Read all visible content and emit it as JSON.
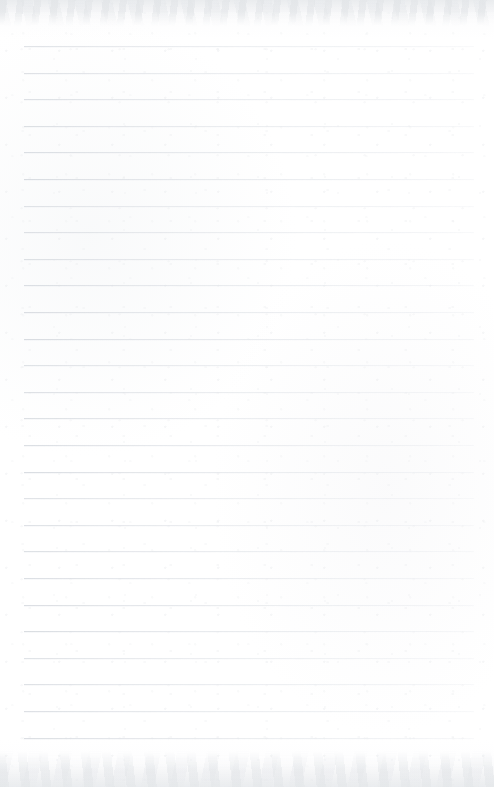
{
  "document": {
    "type": "lined-notebook-paper",
    "title": "",
    "content_text": "",
    "is_blank": true,
    "page_width": 494,
    "page_height": 787
  },
  "paper": {
    "background_color": "#fefefe",
    "texture": "subtle paper grain with mottled scan artifact bands at top and bottom edges",
    "edge_bands": [
      {
        "name": "top-scan-texture",
        "position": "top",
        "height": 26
      },
      {
        "name": "bottom-scan-texture",
        "position": "bottom",
        "height": 36
      }
    ]
  },
  "ruling": {
    "line_color": "#d6dadf",
    "line_color_faded": "#eef0f3",
    "line_count": 27,
    "first_line_y": 46,
    "line_spacing": 26.6,
    "line_start_x": 24,
    "line_end_x": 474,
    "line_thickness": 1,
    "has_vertical_margin_rule": false,
    "lines_y": [
      46,
      72.6,
      99.2,
      125.8,
      152.4,
      179,
      205.6,
      232.2,
      258.8,
      285.4,
      312,
      338.6,
      365.2,
      391.8,
      418.4,
      445,
      471.6,
      498.2,
      524.8,
      551.4,
      578,
      604.6,
      631.2,
      657.8,
      684.4,
      711,
      737.6
    ]
  }
}
